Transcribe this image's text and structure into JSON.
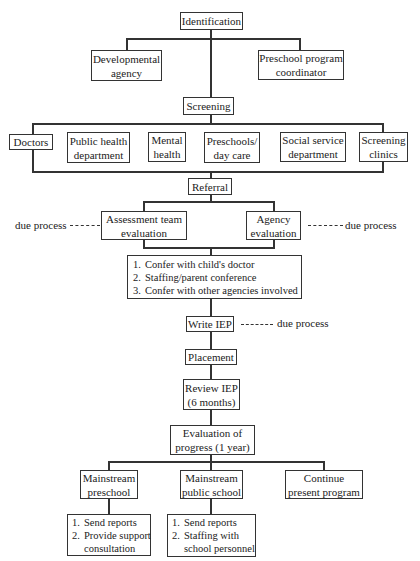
{
  "diagram": {
    "identification": "Identification",
    "identification_children": [
      "Developmental agency",
      "Preschool program coordinator"
    ],
    "developmental_agency": [
      "Developmental",
      "agency"
    ],
    "preschool_coordinator": [
      "Preschool program",
      "coordinator"
    ],
    "screening": "Screening",
    "screening_sources": [
      {
        "lines": [
          "Doctors"
        ]
      },
      {
        "lines": [
          "Public health",
          "department"
        ]
      },
      {
        "lines": [
          "Mental",
          "health"
        ]
      },
      {
        "lines": [
          "Preschools/",
          "day care"
        ]
      },
      {
        "lines": [
          "Social service",
          "department"
        ]
      },
      {
        "lines": [
          "Screening",
          "clinics"
        ]
      }
    ],
    "referral": "Referral",
    "assessment_team": [
      "Assessment team",
      "evaluation"
    ],
    "agency_evaluation": [
      "Agency",
      "evaluation"
    ],
    "due_process_left": "due process",
    "due_process_right": "due process",
    "due_process_iep": "due process",
    "confer_steps": [
      {
        "n": "1.",
        "text": "Confer with child's doctor"
      },
      {
        "n": "2.",
        "text": "Staffing/parent conference"
      },
      {
        "n": "3.",
        "text": "Confer with other agencies involved"
      }
    ],
    "write_iep": "Write IEP",
    "placement": "Placement",
    "review_iep": [
      "Review IEP",
      "(6 months)"
    ],
    "evaluation_progress": [
      "Evaluation of",
      "progress (1 year)"
    ],
    "outcomes": {
      "mainstream_preschool": [
        "Mainstream",
        "preschool"
      ],
      "mainstream_public_school": [
        "Mainstream",
        "public school"
      ],
      "continue_program": [
        "Continue",
        "present program"
      ]
    },
    "preschool_steps": {
      "s1n": "1.",
      "s1": "Send reports",
      "s2n": "2.",
      "s2": "Provide support",
      "s2b": "consultation"
    },
    "public_school_steps": {
      "s1n": "1.",
      "s1": "Send reports",
      "s2n": "2.",
      "s2": "Staffing with",
      "s2b": "school personnel"
    }
  }
}
